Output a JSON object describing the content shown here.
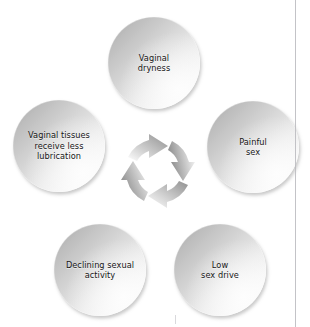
{
  "diagram": {
    "type": "cycle",
    "title": "",
    "background_color": "#ffffff",
    "node_fill_start": "#a8a8a8",
    "node_fill_end": "#fbfbfb",
    "text_color": "#161616",
    "arrow_color": "#9a9a9a",
    "node_count": 5,
    "cycle_direction": "clockwise",
    "nodes": [
      {
        "id": "vaginal-dryness",
        "label": "Vaginal\ndryness",
        "position": "top"
      },
      {
        "id": "painful-sex",
        "label": "Painful\nsex",
        "position": "right"
      },
      {
        "id": "low-sex-drive",
        "label": "Low\nsex drive",
        "position": "bottom-right"
      },
      {
        "id": "declining-sexual-activity",
        "label": "Declining sexual\nactivity",
        "position": "bottom-left"
      },
      {
        "id": "vaginal-tissues-less-lubrication",
        "label": "Vaginal tissues\nreceive less\nlubrication",
        "position": "left"
      }
    ],
    "center_graphic": {
      "name": "circular-arrows-icon",
      "arrow_count": 4,
      "description": "Four curved gray arrows forming a clockwise ring"
    }
  }
}
